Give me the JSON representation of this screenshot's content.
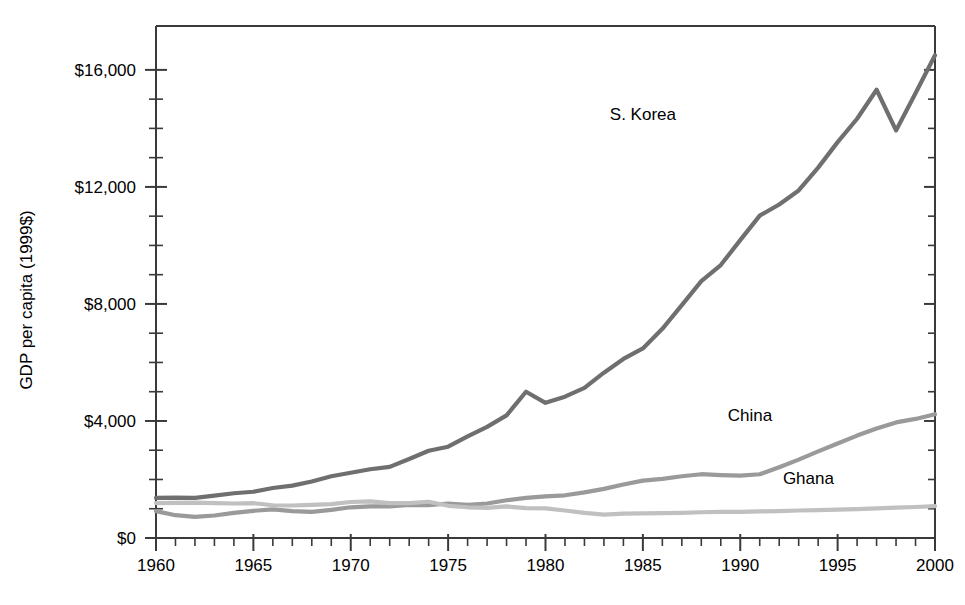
{
  "chart_data": {
    "type": "line",
    "title": "",
    "subtitle": "",
    "xlabel": "",
    "ylabel": "GDP per capita (1999$)",
    "xlim": [
      1960,
      2000
    ],
    "ylim": [
      0,
      17500
    ],
    "grid": false,
    "legend_position": "inline-annotations",
    "y_tick_labels": [
      "$0",
      "$4,000",
      "$8,000",
      "$12,000",
      "$16,000"
    ],
    "y_tick_values": [
      0,
      4000,
      8000,
      12000,
      16000
    ],
    "y_minor_tick_interval": 1000,
    "x_tick_labels": [
      "1960",
      "1965",
      "1970",
      "1975",
      "1980",
      "1985",
      "1990",
      "1995",
      "2000"
    ],
    "x_tick_values": [
      1960,
      1965,
      1970,
      1975,
      1980,
      1985,
      1990,
      1995,
      2000
    ],
    "x_minor_tick_interval": 1,
    "x": [
      1960,
      1961,
      1962,
      1963,
      1964,
      1965,
      1966,
      1967,
      1968,
      1969,
      1970,
      1971,
      1972,
      1973,
      1974,
      1975,
      1976,
      1977,
      1978,
      1979,
      1980,
      1981,
      1982,
      1983,
      1984,
      1985,
      1986,
      1987,
      1988,
      1989,
      1990,
      1991,
      1992,
      1993,
      1994,
      1995,
      1996,
      1997,
      1998,
      1999,
      2000
    ],
    "series": [
      {
        "name": "S. Korea",
        "color": "#706f70",
        "label_x": 1985.0,
        "label_y": 14300,
        "values": [
          1370,
          1380,
          1370,
          1450,
          1530,
          1580,
          1710,
          1790,
          1930,
          2110,
          2230,
          2350,
          2430,
          2700,
          2980,
          3120,
          3470,
          3800,
          4190,
          5000,
          4620,
          4830,
          5130,
          5650,
          6120,
          6480,
          7150,
          7960,
          8780,
          9330,
          10180,
          11020,
          11400,
          11880,
          12660,
          13530,
          14330,
          15320,
          13930,
          15200,
          16500
        ]
      },
      {
        "name": "China",
        "color": "#9a9a9a",
        "label_x": 1990.5,
        "label_y": 4000,
        "values": [
          920,
          780,
          720,
          770,
          860,
          930,
          980,
          920,
          890,
          960,
          1050,
          1080,
          1080,
          1130,
          1120,
          1180,
          1130,
          1180,
          1290,
          1370,
          1420,
          1460,
          1560,
          1680,
          1830,
          1960,
          2020,
          2110,
          2180,
          2150,
          2130,
          2180,
          2420,
          2680,
          2960,
          3230,
          3500,
          3740,
          3950,
          4070,
          4230
        ]
      },
      {
        "name": "Ghana",
        "color": "#c0c0c0",
        "label_x": 1993.5,
        "label_y": 1830,
        "values": [
          1190,
          1200,
          1210,
          1190,
          1180,
          1190,
          1120,
          1110,
          1130,
          1160,
          1230,
          1250,
          1190,
          1190,
          1240,
          1100,
          1050,
          1030,
          1080,
          1020,
          1010,
          940,
          860,
          800,
          830,
          840,
          850,
          860,
          880,
          890,
          890,
          910,
          920,
          940,
          950,
          970,
          990,
          1010,
          1040,
          1060,
          1090
        ]
      }
    ]
  },
  "axes": {
    "y_axis_title": "GDP per capita (1999$)"
  }
}
